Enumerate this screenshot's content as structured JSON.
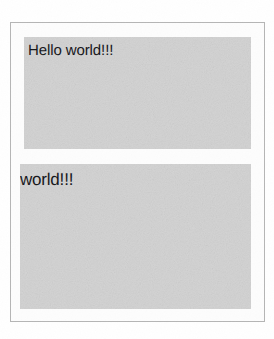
{
  "window": {
    "name": "hello-world-window",
    "border_color": "#b5b5b5",
    "background_color": "#fdfdfd"
  },
  "panels": [
    {
      "id": "greeting",
      "label": "Hello world!!!",
      "background_color": "#d2d2d2",
      "text_color": "#16161a"
    },
    {
      "id": "echo",
      "label": "world!!!",
      "background_color": "#d2d2d2",
      "text_color": "#16161a"
    }
  ],
  "page": {
    "background_color": "#ffffff"
  }
}
